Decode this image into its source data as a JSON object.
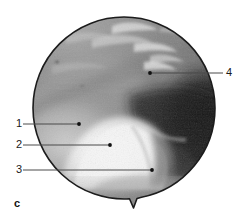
{
  "figure": {
    "panel_letter": "c",
    "type": "arthroscopic-photograph",
    "viewport_shape": "circle-with-bottom-notch"
  },
  "callouts": [
    {
      "id": "callout-1",
      "label": "1",
      "label_x": 16,
      "label_y": 119,
      "line_x1": 23,
      "line_y1": 124,
      "line_x2": 79,
      "line_y2": 124,
      "dot_x": 79,
      "dot_y": 124,
      "side": "left"
    },
    {
      "id": "callout-2",
      "label": "2",
      "label_x": 16,
      "label_y": 140,
      "line_x1": 23,
      "line_y1": 145,
      "line_x2": 110,
      "line_y2": 145,
      "dot_x": 110,
      "dot_y": 145,
      "side": "left"
    },
    {
      "id": "callout-3",
      "label": "3",
      "label_x": 16,
      "label_y": 165,
      "line_x1": 23,
      "line_y1": 170,
      "line_x2": 152,
      "line_y2": 170,
      "dot_x": 152,
      "dot_y": 170,
      "side": "left"
    },
    {
      "id": "callout-4",
      "label": "4",
      "label_x": 226,
      "label_y": 68,
      "line_x1": 150,
      "line_y1": 73,
      "line_x2": 223,
      "line_y2": 73,
      "dot_x": 150,
      "dot_y": 73,
      "side": "right"
    }
  ],
  "colors": {
    "background": "#ffffff",
    "scope_border": "#1c1c1c",
    "leader_line": "#4a4a4a",
    "leader_dot": "#111111",
    "label_text": "#1a1a1a",
    "tissue_mid_gray": "#8e8e8e",
    "tissue_light": "#c9c9c9",
    "tissue_bright": "#f2f2f2",
    "tissue_dark": "#1a1a1a",
    "tissue_shadow": "#3c3c3c"
  },
  "geometry": {
    "circle_cx": 124,
    "circle_cy": 108,
    "circle_r": 91,
    "notch_x": 133,
    "notch_y_top": 198,
    "notch_y_tip": 208
  }
}
